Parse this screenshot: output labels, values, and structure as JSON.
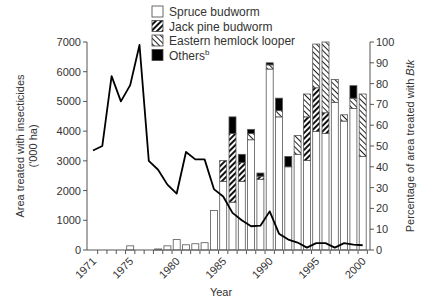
{
  "chart_data": {
    "type": "bar",
    "title": "",
    "xlabel": "Year",
    "ylabel": "Area treated with insecticides ('000 ha)",
    "ylabel_line1": "Area treated with insecticides",
    "ylabel_line2": "('000 ha)",
    "y2label": "Percentage of area treated with Btk",
    "y2label_prefix": "Percentage of area treated with ",
    "y2label_italic": "Btk",
    "ylim": [
      0,
      7000
    ],
    "y2lim": [
      0,
      100
    ],
    "yticks": [
      0,
      1000,
      2000,
      3000,
      4000,
      5000,
      6000,
      7000
    ],
    "y2ticks": [
      0,
      10,
      20,
      30,
      40,
      50,
      60,
      70,
      80,
      90,
      100
    ],
    "xtick_labels": [
      "1971",
      "1975",
      "1980",
      "1985",
      "1990",
      "1995",
      "2000"
    ],
    "grid": false,
    "legend_position": "top-center",
    "legend": [
      {
        "label": "Spruce budworm",
        "pattern": "white"
      },
      {
        "label": "Jack pine budworm",
        "pattern": "dense-hatch"
      },
      {
        "label": "Eastern hemlock looper",
        "pattern": "light-hatch"
      },
      {
        "label": "Others",
        "superscript": "b",
        "pattern": "black"
      }
    ],
    "x": [
      1971,
      1972,
      1973,
      1974,
      1975,
      1976,
      1977,
      1978,
      1979,
      1980,
      1981,
      1982,
      1983,
      1984,
      1985,
      1986,
      1987,
      1988,
      1989,
      1990,
      1991,
      1992,
      1993,
      1994,
      1995,
      1996,
      1997,
      1998,
      1999,
      2000
    ],
    "line_series": {
      "name": "Area treated with insecticides ('000 ha)",
      "axis": "left",
      "values": [
        3350,
        3500,
        5850,
        5000,
        5550,
        6900,
        3000,
        2700,
        2200,
        1900,
        3300,
        3050,
        3050,
        2050,
        1800,
        1250,
        1000,
        800,
        820,
        1300,
        550,
        350,
        250,
        80,
        230,
        230,
        80,
        230,
        180,
        160
      ]
    },
    "series": [
      {
        "name": "Spruce budworm",
        "axis": "right",
        "values": [
          0,
          0,
          0,
          0,
          2,
          0,
          0,
          0.5,
          2,
          5,
          2.5,
          3,
          3.5,
          19,
          33,
          23,
          33,
          53,
          34,
          87,
          64,
          40,
          46,
          43,
          57,
          56,
          71,
          62,
          68,
          45
        ]
      },
      {
        "name": "Jack pine budworm",
        "axis": "right",
        "values": [
          0,
          0,
          0,
          0,
          0,
          0,
          0,
          0,
          0,
          0,
          0,
          0,
          0,
          0,
          10,
          33,
          9,
          0,
          1.5,
          0,
          0,
          0,
          0,
          21,
          21,
          10,
          0,
          0,
          0,
          0
        ]
      },
      {
        "name": "Eastern hemlock looper",
        "axis": "right",
        "values": [
          0,
          0,
          0,
          0,
          0,
          0,
          0,
          0,
          0,
          0,
          0,
          0,
          0,
          0,
          0,
          0,
          0,
          3,
          0,
          2,
          3,
          0,
          9,
          11,
          21,
          34,
          11,
          3,
          5,
          30
        ]
      },
      {
        "name": "Others",
        "axis": "right",
        "values": [
          0,
          0,
          0,
          0,
          0,
          0,
          0,
          0,
          0,
          0,
          0,
          0,
          0,
          0,
          0,
          8,
          4,
          2,
          1.5,
          1,
          6,
          5,
          0,
          0,
          0,
          0,
          0,
          0,
          6,
          0
        ]
      }
    ]
  }
}
